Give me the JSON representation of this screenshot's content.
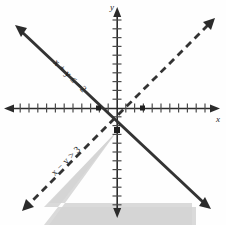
{
  "figure": {
    "background_color": "#fefefe",
    "shaded_region_color": "#d4d4d4",
    "line_color": "#333333",
    "axis_color": "#2b2b2b"
  },
  "axes": {
    "x_label": "x",
    "y_label": "y",
    "origin_px": {
      "x": 117,
      "y": 108
    },
    "unit_px": 8.8,
    "x_range": [
      -13,
      12
    ],
    "y_range": [
      -13,
      12
    ],
    "x_ticks": [
      -12,
      -11,
      -10,
      -9,
      -8,
      -7,
      -6,
      -5,
      -4,
      -3,
      -2,
      -1,
      1,
      2,
      3,
      4,
      5,
      6,
      7,
      8,
      9,
      10,
      11
    ],
    "y_ticks": [
      -12,
      -11,
      -10,
      -9,
      -8,
      -7,
      -6,
      -5,
      -4,
      -3,
      -2,
      -1,
      1,
      2,
      3,
      4,
      5,
      6,
      7,
      8,
      9,
      10,
      11
    ],
    "tick_labels_shown": false,
    "arrowheads": [
      "left",
      "right",
      "up",
      "down"
    ]
  },
  "chart_data": {
    "type": "line",
    "title": "",
    "xlabel": "x",
    "ylabel": "y",
    "xlim": [
      -13,
      12
    ],
    "ylim": [
      -13,
      12
    ],
    "grid": false,
    "legend": "none",
    "series": [
      {
        "name": "x + y <= -2",
        "label": "x + y ≤ −2",
        "style": "solid",
        "slope": -1,
        "intercept": -2,
        "x_intercept": -2,
        "y_intercept": -2,
        "boundary_included": true,
        "shaded_side": "below",
        "label_position": {
          "x": -5.5,
          "y": 3.4
        },
        "label_rotation_deg": 45,
        "endpoints": [
          [
            -11,
            9
          ],
          [
            11,
            -13
          ]
        ],
        "arrow_ends": [
          "start",
          "end"
        ]
      },
      {
        "name": "x - y > 3",
        "label": "x − y > 3",
        "style": "dashed",
        "slope": 1,
        "intercept": -3,
        "x_intercept": 3,
        "y_intercept": -3,
        "boundary_included": false,
        "shaded_side": "below",
        "label_position": {
          "x": -6.2,
          "y": -6.6
        },
        "label_rotation_deg": -45,
        "endpoints": [
          [
            -10,
            -13
          ],
          [
            12,
            9
          ]
        ],
        "arrow_ends": [
          "start",
          "end"
        ]
      }
    ],
    "marked_points": [
      {
        "label": "",
        "x": -2,
        "y": 0,
        "marker": "square"
      },
      {
        "label": "",
        "x": 3,
        "y": 0,
        "marker": "square"
      },
      {
        "label": "",
        "x": 0.5,
        "y": -2.5,
        "marker": "square"
      }
    ],
    "solution_region": {
      "description": "Shaded triangular region below both boundary lines",
      "vertices": [
        [
          0.5,
          -2.5
        ],
        [
          -10.5,
          -13
        ],
        [
          11.5,
          -13
        ]
      ],
      "fill": "#d4d4d4"
    },
    "annotations": [
      {
        "text": "x + y ≤ −2",
        "x": -5.5,
        "y": 3.4,
        "rotation": 45
      },
      {
        "text": "x − y > 3",
        "x": -6.2,
        "y": -6.6,
        "rotation": -45
      }
    ]
  },
  "labels": {
    "solid_line": "x + y ≤ −2",
    "dashed_line": "x − y > 3",
    "x_axis": "x",
    "y_axis": "y"
  }
}
